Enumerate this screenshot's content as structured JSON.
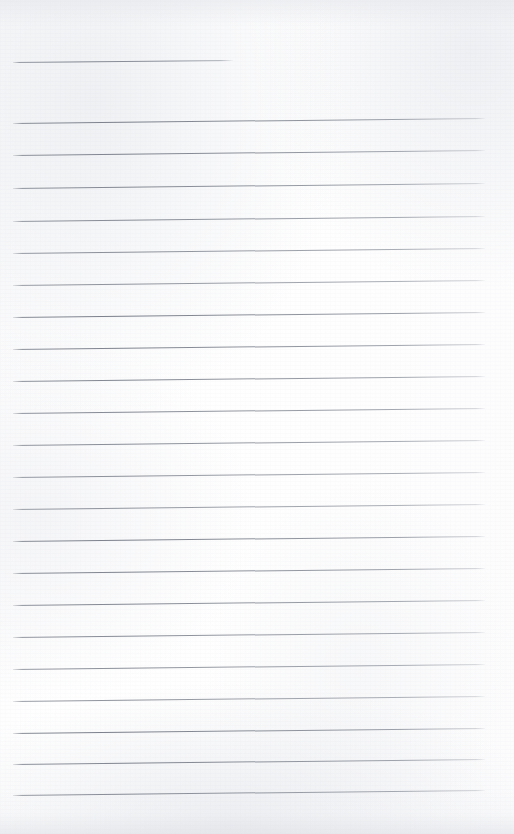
{
  "document": {
    "kind": "scanned-blank-ruled-notebook-page",
    "title": "",
    "body_text": "",
    "page_width": 514,
    "page_height": 834,
    "background_color": "#fdfdfd",
    "rule_color": "#7d8290",
    "header_rule": {
      "label": "header-rule",
      "x_start": 13,
      "x_end": 233,
      "y": 62,
      "tilt_degrees": -0.55,
      "handwriting": ""
    },
    "ruling": {
      "label": "ruled-lines",
      "count": 22,
      "x_start": 13,
      "x_end": 485,
      "first_y": 123,
      "line_spacing": 32,
      "tilt_degrees": -0.62,
      "thickness_px": 1
    },
    "lines": [
      {
        "index": 1,
        "y": 123,
        "text": ""
      },
      {
        "index": 2,
        "y": 155,
        "text": ""
      },
      {
        "index": 3,
        "y": 188,
        "text": ""
      },
      {
        "index": 4,
        "y": 221,
        "text": ""
      },
      {
        "index": 5,
        "y": 253,
        "text": ""
      },
      {
        "index": 6,
        "y": 285,
        "text": ""
      },
      {
        "index": 7,
        "y": 317,
        "text": ""
      },
      {
        "index": 8,
        "y": 349,
        "text": ""
      },
      {
        "index": 9,
        "y": 381,
        "text": ""
      },
      {
        "index": 10,
        "y": 413,
        "text": ""
      },
      {
        "index": 11,
        "y": 445,
        "text": ""
      },
      {
        "index": 12,
        "y": 477,
        "text": ""
      },
      {
        "index": 13,
        "y": 509,
        "text": ""
      },
      {
        "index": 14,
        "y": 541,
        "text": ""
      },
      {
        "index": 15,
        "y": 573,
        "text": ""
      },
      {
        "index": 16,
        "y": 605,
        "text": ""
      },
      {
        "index": 17,
        "y": 637,
        "text": ""
      },
      {
        "index": 18,
        "y": 669,
        "text": ""
      },
      {
        "index": 19,
        "y": 701,
        "text": ""
      },
      {
        "index": 20,
        "y": 733,
        "text": ""
      },
      {
        "index": 21,
        "y": 764,
        "text": ""
      },
      {
        "index": 22,
        "y": 795,
        "text": ""
      }
    ]
  }
}
